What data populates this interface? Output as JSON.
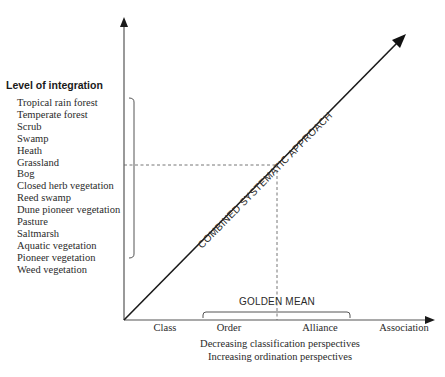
{
  "diagram": {
    "y_axis": {
      "title": "Level of integration",
      "vegetation_types": [
        "Tropical rain forest",
        "Temperate forest",
        "Scrub",
        "Swamp",
        "Heath",
        "Grassland",
        "Bog",
        "Closed herb vegetation",
        "Reed swamp",
        "Dune pioneer vegetation",
        "Pasture",
        "Saltmarsh",
        "Aquatic vegetation",
        "Pioneer vegetation",
        "Weed vegetation"
      ]
    },
    "x_axis": {
      "ranks": [
        "Class",
        "Order",
        "Alliance",
        "Association"
      ],
      "caption_line_1": "Decreasing classification perspectives",
      "caption_line_2": "Increasing ordination perspectives"
    },
    "diagonal_label": "COMBINED SYSTEMATIC APPROACH",
    "golden_mean_label": "GOLDEN MEAN",
    "colors": {
      "line": "#1a1a1a",
      "axis": "#555555",
      "bracket": "#555555",
      "dashed": "#666666",
      "text": "#2a2a2a"
    }
  }
}
